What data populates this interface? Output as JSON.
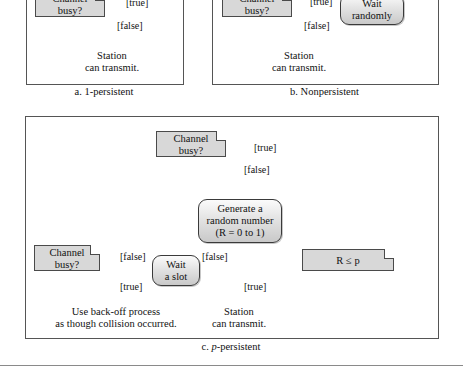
{
  "figure": {
    "panels": [
      {
        "id": "a",
        "caption_prefix": "a.",
        "caption_text": "1-persistent",
        "nodes": {
          "channel_busy_note": "Channel\nbusy?",
          "station_transmit": "Station\ncan transmit."
        },
        "guards": {
          "true": "[true]",
          "false": "[false]"
        }
      },
      {
        "id": "b",
        "caption_prefix": "b.",
        "caption_text": "Nonpersistent",
        "nodes": {
          "channel_busy_note": "Channel\nbusy?",
          "wait_randomly": "Wait\nrandomly",
          "station_transmit": "Station\ncan transmit."
        },
        "guards": {
          "true": "[true]",
          "false": "[false]"
        }
      },
      {
        "id": "c",
        "caption_prefix": "c.",
        "caption_italic": "p",
        "caption_text": "-persistent",
        "nodes": {
          "channel_busy_note_top": "Channel\nbusy?",
          "generate_random": "Generate a\nrandom number\n(R = 0 to 1)",
          "r_le_p_note": "R ≤ p",
          "wait_a_slot": "Wait\na slot",
          "channel_busy_note_left": "Channel\nbusy?",
          "backoff": "Use back-off process\nas though collision occurred.",
          "station_transmit": "Station\ncan transmit."
        },
        "guards": {
          "top_true": "[true]",
          "top_false": "[false]",
          "rp_false": "[false]",
          "rp_true": "[true]",
          "left_false": "[false]",
          "left_true": "[true]"
        }
      }
    ],
    "labels": {
      "channel_busy_line1": "Channel",
      "channel_busy_line2": "busy?",
      "wait_randomly_line1": "Wait",
      "wait_randomly_line2": "randomly",
      "station_line1": "Station",
      "station_line2": "can transmit.",
      "generate_line1": "Generate a",
      "generate_line2": "random number",
      "generate_line3": "(R = 0 to 1)",
      "r_le_p": "R ≤ p",
      "wait_slot_line1": "Wait",
      "wait_slot_line2": "a slot",
      "backoff_line1": "Use back-off process",
      "backoff_line2": "as though collision occurred.",
      "guard_true": "[true]",
      "guard_false": "[false]",
      "caption_a_prefix": "a.",
      "caption_a_text": "1-persistent",
      "caption_b_prefix": "b.",
      "caption_b_text": "Nonpersistent",
      "caption_c_prefix": "c.",
      "caption_c_italic": "p",
      "caption_c_text": "-persistent"
    },
    "colors": {
      "note_fill": "#d8d8d8",
      "note_stroke": "#4a4a4a",
      "activity_stroke": "#3a3a3a",
      "line": "#1a1a1a",
      "diamond_fill": "#1c1c1c",
      "panel_border": "#555555",
      "background": "#ffffff"
    }
  }
}
